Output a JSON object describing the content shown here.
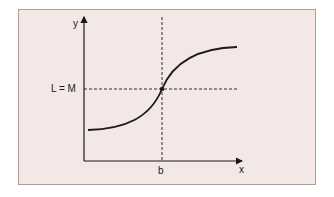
{
  "diagram": {
    "y_axis_label": "y",
    "x_axis_label": "x",
    "y_marker_label": "L = M",
    "x_marker_label": "b",
    "colors": {
      "background": "#f3e8e6",
      "border": "#b59a96",
      "line": "#1a1a1a"
    },
    "curve": "sigmoid (S-shaped) increasing curve crossing the point (b, L = M)"
  }
}
